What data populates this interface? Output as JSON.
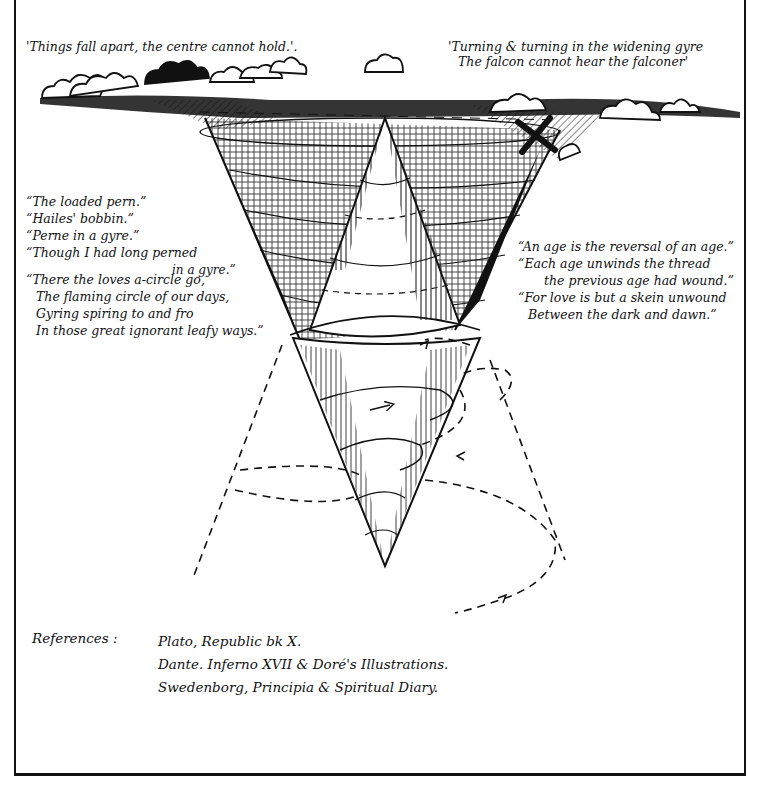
{
  "diagram": {
    "type": "hand-drawn illustration",
    "elements": {
      "upper_cone": "inverted cone opening upward from horizon, heavily cross-hatched",
      "inner_cone": "upright cone rising inside the upper cone, spiral lines with arrows",
      "lower_cone": "cone narrowing downward to an apex, spiral with arrowheads",
      "dashed_spiral": "widening dashed spiral around lower cone with arrowheads",
      "clouds": "band of clouds along the horizon line",
      "bird": "falcon silhouette (X shape) at upper right"
    }
  },
  "quotes": {
    "top_left": "'Things fall apart, the centre cannot hold.'.",
    "top_right": [
      "'Turning & turning in the widening gyre",
      "The falcon cannot hear the falconer'"
    ],
    "left": [
      "“The loaded pern.”",
      "“Hailes' bobbin.”",
      "“Perne in a gyre.”",
      "“Though I had long perned",
      "in a gyre.”",
      "“There the loves a-circle go,",
      "The flaming circle of our days,",
      "Gyring spiring to and fro",
      "In those great ignorant leafy ways.”"
    ],
    "right": [
      "“An age is the reversal of an age.”",
      "“Each age unwinds the thread",
      "the previous age had wound.”",
      "“For love is but a skein unwound",
      "Between the dark and dawn.”"
    ]
  },
  "references": {
    "label": "References :",
    "items": [
      "Plato, Republic bk X.",
      "Dante. Inferno XVII & Doré's Illustrations.",
      "Swedenborg, Principia & Spiritual Diary."
    ]
  },
  "colors": {
    "ink": "#111111",
    "paper": "#ffffff"
  }
}
